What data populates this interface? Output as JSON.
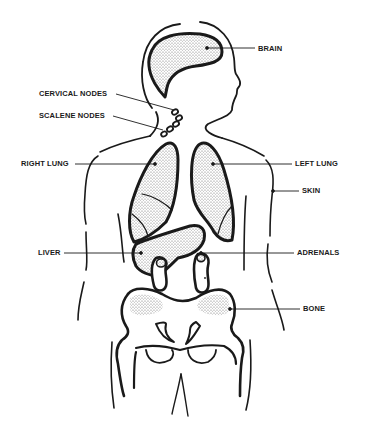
{
  "diagram": {
    "type": "anatomical-illustration",
    "colors": {
      "ink": "#1a1a1a",
      "background": "#ffffff",
      "stipple": "#8a8a8a"
    },
    "labels": [
      {
        "id": "brain",
        "text": "BRAIN",
        "x": 258,
        "y": 46
      },
      {
        "id": "cervical_nodes",
        "text": "CERVICAL NODES",
        "x": 39,
        "y": 90
      },
      {
        "id": "scalene_nodes",
        "text": "SCALENE NODES",
        "x": 39,
        "y": 112
      },
      {
        "id": "right_lung",
        "text": "RIGHT LUNG",
        "x": 21,
        "y": 161
      },
      {
        "id": "left_lung",
        "text": "LEFT LUNG",
        "x": 295,
        "y": 161
      },
      {
        "id": "skin",
        "text": "SKIN",
        "x": 302,
        "y": 188
      },
      {
        "id": "liver",
        "text": "LIVER",
        "x": 38,
        "y": 251
      },
      {
        "id": "adrenals",
        "text": "ADRENALS",
        "x": 297,
        "y": 251
      },
      {
        "id": "bone",
        "text": "BONE",
        "x": 303,
        "y": 306
      }
    ]
  }
}
